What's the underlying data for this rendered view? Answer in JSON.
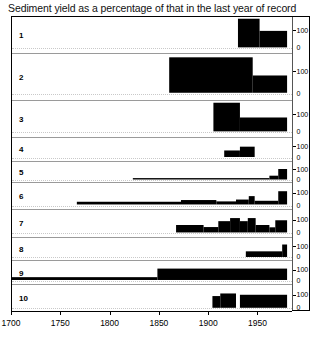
{
  "chart_data": {
    "type": "area",
    "title": "Sediment yield as a percentage of that in the last year of record",
    "xlabel": "",
    "ylabel": "",
    "xlim": [
      1700,
      1985
    ],
    "ylim": [
      0,
      175
    ],
    "grid": true,
    "legend": null,
    "x_ticks": [
      1700,
      1750,
      1800,
      1850,
      1900,
      1950
    ],
    "x_tick_labels": [
      "1700",
      "1750",
      "1800",
      "1850",
      "1900",
      "1950"
    ],
    "y_ticks": [
      0,
      100
    ],
    "y_tick_labels": [
      "0",
      "100"
    ],
    "note": "Ten stacked step-area panels; each panel has its own right-hand axis labelled 0 and 100 (percent of last-year-of-record sediment yield).",
    "panels": [
      {
        "label": "1",
        "ymax": 175,
        "steps": [
          {
            "x0": 1930,
            "x1": 1952,
            "y": 165
          },
          {
            "x0": 1952,
            "x1": 1980,
            "y": 95
          }
        ]
      },
      {
        "label": "2",
        "ymax": 175,
        "steps": [
          {
            "x0": 1860,
            "x1": 1945,
            "y": 160
          },
          {
            "x0": 1945,
            "x1": 1980,
            "y": 78
          }
        ]
      },
      {
        "label": "3",
        "ymax": 175,
        "steps": [
          {
            "x0": 1905,
            "x1": 1932,
            "y": 165
          },
          {
            "x0": 1932,
            "x1": 1980,
            "y": 80
          }
        ]
      },
      {
        "label": "4",
        "ymax": 175,
        "steps": [
          {
            "x0": 1916,
            "x1": 1932,
            "y": 60
          },
          {
            "x0": 1932,
            "x1": 1947,
            "y": 95
          }
        ]
      },
      {
        "label": "5",
        "ymax": 175,
        "steps": [
          {
            "x0": 1823,
            "x1": 1962,
            "y": 14
          },
          {
            "x0": 1962,
            "x1": 1971,
            "y": 38
          },
          {
            "x0": 1971,
            "x1": 1980,
            "y": 105
          }
        ]
      },
      {
        "label": "6",
        "ymax": 175,
        "steps": [
          {
            "x0": 1766,
            "x1": 1872,
            "y": 22
          },
          {
            "x0": 1872,
            "x1": 1908,
            "y": 36
          },
          {
            "x0": 1908,
            "x1": 1928,
            "y": 25
          },
          {
            "x0": 1928,
            "x1": 1941,
            "y": 40
          },
          {
            "x0": 1941,
            "x1": 1947,
            "y": 68
          },
          {
            "x0": 1947,
            "x1": 1971,
            "y": 30
          },
          {
            "x0": 1971,
            "x1": 1980,
            "y": 108
          }
        ]
      },
      {
        "label": "7",
        "ymax": 175,
        "steps": [
          {
            "x0": 1867,
            "x1": 1895,
            "y": 58
          },
          {
            "x0": 1895,
            "x1": 1910,
            "y": 42
          },
          {
            "x0": 1910,
            "x1": 1922,
            "y": 88
          },
          {
            "x0": 1922,
            "x1": 1932,
            "y": 112
          },
          {
            "x0": 1932,
            "x1": 1940,
            "y": 88
          },
          {
            "x0": 1940,
            "x1": 1948,
            "y": 112
          },
          {
            "x0": 1948,
            "x1": 1962,
            "y": 58
          },
          {
            "x0": 1962,
            "x1": 1968,
            "y": 40
          },
          {
            "x0": 1968,
            "x1": 1980,
            "y": 95
          }
        ]
      },
      {
        "label": "8",
        "ymax": 175,
        "steps": [
          {
            "x0": 1938,
            "x1": 1975,
            "y": 52
          },
          {
            "x0": 1975,
            "x1": 1980,
            "y": 115
          }
        ]
      },
      {
        "label": "9",
        "ymax": 175,
        "steps": [
          {
            "x0": 1700,
            "x1": 1848,
            "y": 26
          },
          {
            "x0": 1848,
            "x1": 1980,
            "y": 105
          }
        ]
      },
      {
        "label": "10",
        "ymax": 175,
        "steps": [
          {
            "x0": 1904,
            "x1": 1912,
            "y": 90
          },
          {
            "x0": 1912,
            "x1": 1928,
            "y": 110
          },
          {
            "x0": 1932,
            "x1": 1980,
            "y": 100
          }
        ]
      }
    ]
  }
}
